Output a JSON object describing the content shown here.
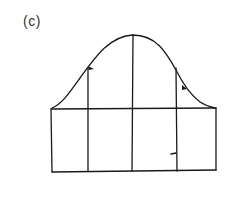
{
  "figure": {
    "label": "(c)",
    "stroke_color": "#1a1a1a",
    "background": "#ffffff"
  },
  "diagram": {
    "type": "bell-curve-over-grid",
    "curve": {
      "shape": "bell",
      "peak": [
        133,
        35
      ],
      "left_end": [
        52,
        108
      ],
      "right_end": [
        215,
        108
      ]
    },
    "grid": {
      "left": 52,
      "right": 215,
      "top": 109,
      "bottom": 171,
      "vertical_lines_x": [
        88,
        133,
        177
      ]
    },
    "markers": [
      {
        "type": "arrowhead",
        "at": [
          91,
          69
        ]
      },
      {
        "type": "arrowhead",
        "at": [
          184,
          88
        ]
      },
      {
        "type": "tick",
        "at": [
          172,
          154
        ]
      }
    ]
  }
}
